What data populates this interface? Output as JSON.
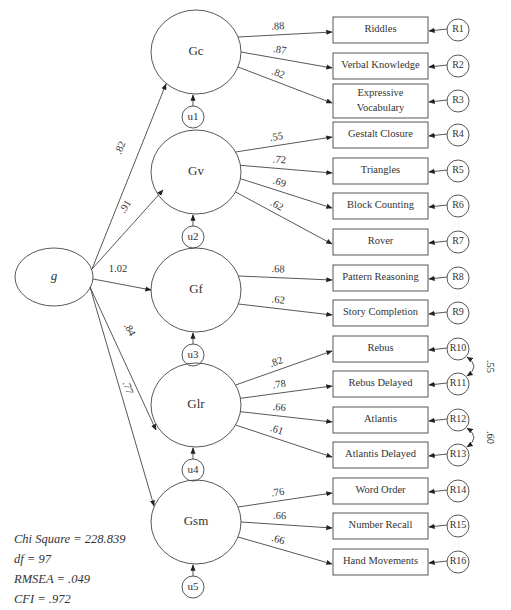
{
  "diagram": {
    "type": "structural-equation-model",
    "general_factor": {
      "label": "g"
    },
    "second_order_loadings": [
      {
        "factor": "Gc",
        "value": ".82"
      },
      {
        "factor": "Gv",
        "value": ".91"
      },
      {
        "factor": "Gf",
        "value": "1.02"
      },
      {
        "factor": "Glr",
        "value": ".84"
      },
      {
        "factor": "Gsm",
        "value": ".77"
      }
    ],
    "factors": [
      {
        "label": "Gc",
        "disturbance": "u1",
        "indicators": [
          {
            "label": "Riddles",
            "loading": ".88",
            "error": "R1"
          },
          {
            "label": "Verbal Knowledge",
            "loading": ".87",
            "error": "R2"
          },
          {
            "label": "Expressive",
            "label2": "Vocabulary",
            "loading": ".82",
            "error": "R3"
          }
        ]
      },
      {
        "label": "Gv",
        "disturbance": "u2",
        "indicators": [
          {
            "label": "Gestalt Closure",
            "loading": ".55",
            "error": "R4"
          },
          {
            "label": "Triangles",
            "loading": ".72",
            "error": "R5"
          },
          {
            "label": "Block Counting",
            "loading": ".69",
            "error": "R6"
          },
          {
            "label": "Rover",
            "loading": ".62",
            "error": "R7"
          }
        ]
      },
      {
        "label": "Gf",
        "disturbance": "u3",
        "indicators": [
          {
            "label": "Pattern Reasoning",
            "loading": ".68",
            "error": "R8"
          },
          {
            "label": "Story Completion",
            "loading": ".62",
            "error": "R9"
          }
        ]
      },
      {
        "label": "Glr",
        "disturbance": "u4",
        "indicators": [
          {
            "label": "Rebus",
            "loading": ".82",
            "error": "R10"
          },
          {
            "label": "Rebus Delayed",
            "loading": ".78",
            "error": "R11"
          },
          {
            "label": "Atlantis",
            "loading": ".66",
            "error": "R12"
          },
          {
            "label": "Atlantis Delayed",
            "loading": ".61",
            "error": "R13"
          }
        ]
      },
      {
        "label": "Gsm",
        "disturbance": "u5",
        "indicators": [
          {
            "label": "Word Order",
            "loading": ".76",
            "error": "R14"
          },
          {
            "label": "Number Recall",
            "loading": ".66",
            "error": "R15"
          },
          {
            "label": "Hand Movements",
            "loading": ".66",
            "error": "R16"
          }
        ]
      }
    ],
    "error_correlations": [
      {
        "between": [
          "R10",
          "R11"
        ],
        "value": ".55"
      },
      {
        "between": [
          "R12",
          "R13"
        ],
        "value": ".60"
      }
    ],
    "fit_statistics": {
      "chi_square": "Chi Square = 228.839",
      "df": "df = 97",
      "rmsea": "RMSEA = .049",
      "cfi": "CFI = .972"
    }
  }
}
